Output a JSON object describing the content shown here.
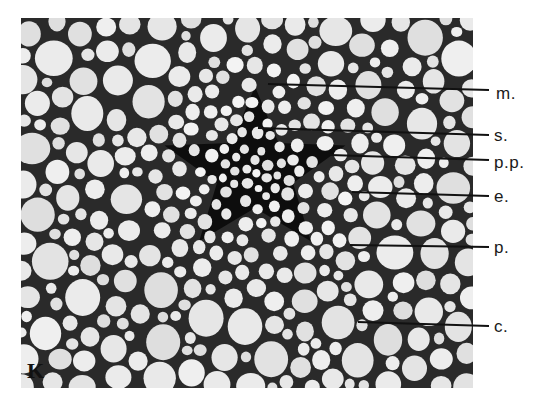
{
  "figure": {
    "panel_letter": "K",
    "colors": {
      "background": "#ffffff",
      "cell_fill": "#e4e4e4",
      "cell_wall": "#1c1c1c",
      "stele_dark": "#111111",
      "label_text": "#1a1a1a",
      "leader_line": "#111111"
    },
    "micrograph_box": {
      "x": 21,
      "y": 18,
      "w": 452,
      "h": 370
    },
    "stele": {
      "cx": 255,
      "cy": 172,
      "r": 110
    },
    "labels": [
      {
        "id": "m",
        "text": "m.",
        "x": 496,
        "y": 93,
        "line": [
          268,
          84,
          489,
          90
        ]
      },
      {
        "id": "s",
        "text": "s.",
        "x": 494,
        "y": 135,
        "line": [
          258,
          128,
          489,
          135
        ]
      },
      {
        "id": "pp",
        "text": "p.p.",
        "x": 494,
        "y": 162,
        "line": [
          330,
          155,
          489,
          160
        ]
      },
      {
        "id": "e",
        "text": "e.",
        "x": 494,
        "y": 196,
        "line": [
          352,
          192,
          489,
          196
        ]
      },
      {
        "id": "p",
        "text": "p.",
        "x": 494,
        "y": 247,
        "line": [
          350,
          245,
          489,
          247
        ]
      },
      {
        "id": "c",
        "text": "c.",
        "x": 494,
        "y": 326,
        "line": [
          358,
          322,
          489,
          326
        ]
      }
    ]
  }
}
